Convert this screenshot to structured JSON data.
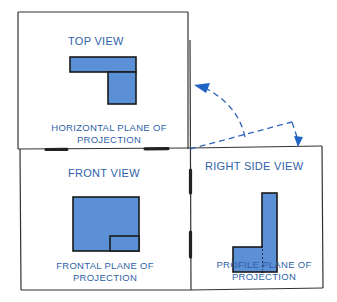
{
  "colors": {
    "text_blue": "#2f5fa8",
    "fill_blue": "#5b8fd6",
    "outline": "#1a1a1a",
    "arrow_blue": "#1f63c4"
  },
  "views": {
    "top": {
      "title": "TOP VIEW",
      "caption_line1": "HORIZONTAL PLANE OF",
      "caption_line2": "PROJECTION"
    },
    "front": {
      "title": "FRONT VIEW",
      "caption_line1": "FRONTAL PLANE OF",
      "caption_line2": "PROJECTION"
    },
    "right": {
      "title": "RIGHT SIDE VIEW",
      "caption_line1": "PROFILE PLANE OF",
      "caption_line2": "PROJECTION"
    }
  },
  "annotations": {
    "rotation_arrows": [
      "fold-up-to-top",
      "fold-down-to-side"
    ]
  }
}
